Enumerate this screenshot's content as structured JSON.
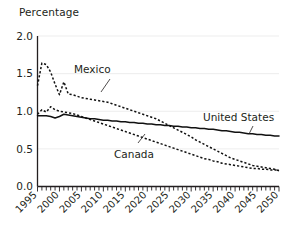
{
  "chart_data": {
    "type": "line",
    "title": "Percentage",
    "xlabel": "",
    "ylabel": "Percentage",
    "xlim": [
      1995,
      2050
    ],
    "ylim": [
      0.0,
      2.0
    ],
    "grid": true,
    "legend_position": "inline-annotations",
    "yticks": [
      "0.0",
      "0.5",
      "1.0",
      "1.5",
      "2.0"
    ],
    "ytick_values": [
      0.0,
      0.5,
      1.0,
      1.5,
      2.0
    ],
    "xticks": [
      "1995",
      "2000",
      "2005",
      "2010",
      "2015",
      "2020",
      "2025",
      "2030",
      "2035",
      "2040",
      "2045",
      "2050"
    ],
    "xtick_values": [
      1995,
      2000,
      2005,
      2010,
      2015,
      2020,
      2025,
      2030,
      2035,
      2040,
      2045,
      2050
    ],
    "x": [
      1995,
      1996,
      1997,
      1998,
      1999,
      2000,
      2001,
      2002,
      2003,
      2004,
      2005,
      2006,
      2007,
      2008,
      2009,
      2010,
      2011,
      2012,
      2013,
      2014,
      2015,
      2016,
      2017,
      2018,
      2019,
      2020,
      2021,
      2022,
      2023,
      2024,
      2025,
      2026,
      2027,
      2028,
      2029,
      2030,
      2031,
      2032,
      2033,
      2034,
      2035,
      2036,
      2037,
      2038,
      2039,
      2040,
      2041,
      2042,
      2043,
      2044,
      2045,
      2046,
      2047,
      2048,
      2049,
      2050
    ],
    "series": [
      {
        "name": "Mexico",
        "style": "dashed",
        "values": [
          1.34,
          1.64,
          1.62,
          1.52,
          1.36,
          1.22,
          1.39,
          1.23,
          1.22,
          1.2,
          1.18,
          1.17,
          1.16,
          1.15,
          1.14,
          1.13,
          1.12,
          1.1,
          1.08,
          1.06,
          1.04,
          1.02,
          1.0,
          0.98,
          0.96,
          0.94,
          0.92,
          0.9,
          0.87,
          0.84,
          0.81,
          0.78,
          0.75,
          0.72,
          0.69,
          0.66,
          0.62,
          0.59,
          0.56,
          0.53,
          0.5,
          0.47,
          0.44,
          0.41,
          0.38,
          0.36,
          0.34,
          0.32,
          0.3,
          0.28,
          0.27,
          0.26,
          0.25,
          0.24,
          0.23,
          0.21
        ]
      },
      {
        "name": "Canada",
        "style": "dashed",
        "values": [
          0.96,
          1.02,
          0.99,
          1.06,
          1.02,
          1.0,
          0.99,
          0.98,
          0.97,
          0.95,
          0.93,
          0.91,
          0.89,
          0.87,
          0.85,
          0.83,
          0.81,
          0.79,
          0.77,
          0.75,
          0.73,
          0.71,
          0.69,
          0.67,
          0.65,
          0.63,
          0.61,
          0.59,
          0.57,
          0.55,
          0.53,
          0.51,
          0.49,
          0.47,
          0.45,
          0.43,
          0.41,
          0.39,
          0.37,
          0.36,
          0.34,
          0.33,
          0.31,
          0.3,
          0.29,
          0.28,
          0.27,
          0.26,
          0.25,
          0.24,
          0.24,
          0.23,
          0.23,
          0.22,
          0.22,
          0.22
        ]
      },
      {
        "name": "United States",
        "style": "solid",
        "values": [
          0.94,
          0.94,
          0.94,
          0.93,
          0.91,
          0.93,
          0.96,
          0.95,
          0.94,
          0.93,
          0.92,
          0.91,
          0.9,
          0.9,
          0.89,
          0.88,
          0.88,
          0.87,
          0.87,
          0.86,
          0.86,
          0.85,
          0.85,
          0.84,
          0.84,
          0.83,
          0.83,
          0.82,
          0.82,
          0.81,
          0.81,
          0.8,
          0.8,
          0.79,
          0.79,
          0.78,
          0.78,
          0.77,
          0.77,
          0.76,
          0.76,
          0.75,
          0.74,
          0.74,
          0.73,
          0.72,
          0.72,
          0.71,
          0.7,
          0.7,
          0.69,
          0.69,
          0.68,
          0.68,
          0.67,
          0.67
        ]
      }
    ],
    "annotations": [
      {
        "text": "Mexico",
        "target_series": "Mexico"
      },
      {
        "text": "Canada",
        "target_series": "Canada"
      },
      {
        "text": "United States",
        "target_series": "United States"
      }
    ]
  }
}
